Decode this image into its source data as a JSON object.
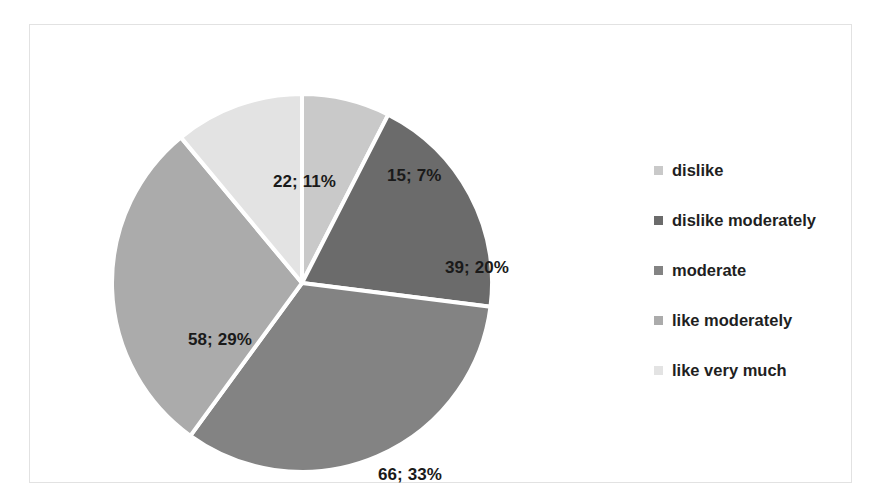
{
  "chart_data": {
    "type": "pie",
    "title": "",
    "subtitle": "",
    "xlabel": "",
    "ylabel": "",
    "grid": false,
    "legend_position": "right",
    "total": 200,
    "start_angle_deg": 0,
    "direction": "clockwise",
    "categories": [
      "dislike",
      "dislike moderately",
      " moderate",
      "like moderately",
      "like very much"
    ],
    "values": [
      15,
      39,
      66,
      58,
      22
    ],
    "percents": [
      7,
      20,
      33,
      29,
      11
    ],
    "slice_colors": [
      "#c9c9c9",
      "#6b6b6b",
      "#838383",
      "#ababab",
      "#e3e3e3"
    ],
    "data_labels": [
      "15; 7%",
      "39; 20%",
      "66; 33%",
      "58; 29%",
      "22; 11%"
    ],
    "slice_separator_color": "#ffffff",
    "plot_background": "#ffffff",
    "frame_color": "#e2e2e2"
  },
  "legend": {
    "items": [
      {
        "label": "dislike",
        "color": "#c9c9c9"
      },
      {
        "label": "dislike moderately",
        "color": "#6b6b6b"
      },
      {
        "label": " moderate",
        "color": "#838383"
      },
      {
        "label": "like moderately",
        "color": "#ababab"
      },
      {
        "label": "like very much",
        "color": "#e3e3e3"
      }
    ]
  }
}
